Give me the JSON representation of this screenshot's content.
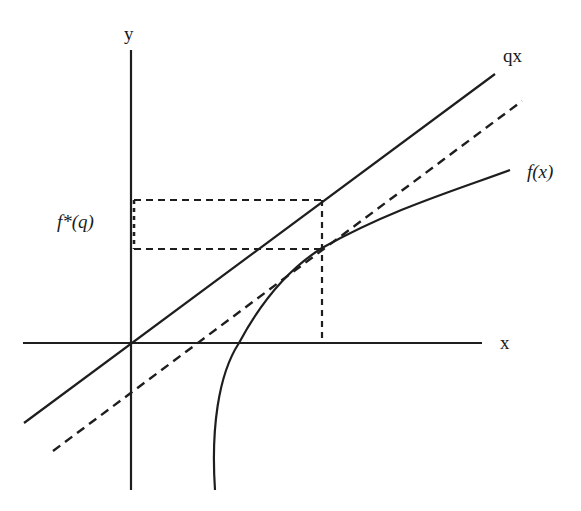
{
  "diagram": {
    "title": "",
    "colors": {
      "stroke": "#1e1e1e",
      "background": "#ffffff"
    },
    "labels": {
      "y_axis": "y",
      "x_axis": "x",
      "line_qx": "qx",
      "curve_fx": "f(x)",
      "intercept": "f*(q)"
    },
    "elements": {
      "y_axis": {
        "x": 131,
        "y_top": 50,
        "y_bottom": 490
      },
      "x_axis": {
        "y": 343,
        "x_left": 23,
        "x_right": 482
      },
      "origin": {
        "x": 131,
        "y": 343
      },
      "line_qx": {
        "style": "solid",
        "from": [
          24,
          423
        ],
        "to": [
          495,
          74
        ]
      },
      "tangent_line": {
        "style": "dashed",
        "from": [
          53,
          451
        ],
        "to": [
          522,
          101
        ]
      },
      "curve_fx": {
        "style": "solid",
        "start": [
          215,
          490
        ],
        "x_intercept": [
          239,
          343
        ],
        "tangency_point": [
          322,
          248
        ],
        "end": [
          510,
          170
        ]
      },
      "dashed_rectangle": {
        "left": 133,
        "right": 322,
        "top": 200,
        "bottom": 249
      },
      "dashed_drop_line": {
        "x": 322,
        "y_top": 200,
        "y_bottom": 340
      }
    }
  }
}
